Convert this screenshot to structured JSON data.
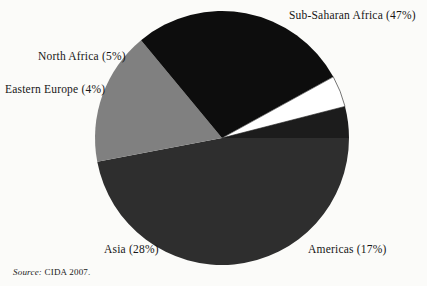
{
  "chart_data": {
    "type": "pie",
    "title": "",
    "subtitle": "",
    "xlabel": "",
    "ylabel": "",
    "legend_position": "none",
    "grid": false,
    "units": "percent",
    "total": 101,
    "categories": [
      "Sub-Saharan Africa",
      "Americas",
      "Asia",
      "Eastern Europe",
      "North Africa"
    ],
    "values": [
      47,
      17,
      28,
      4,
      5
    ],
    "labels": [
      "Sub-Saharan Africa (47%)",
      "Americas (17%)",
      "Asia (28%)",
      "Eastern Europe (4%)",
      "North Africa (5%)"
    ],
    "slices": [
      {
        "name": "Sub-Saharan Africa",
        "value": 47,
        "label": "Sub-Saharan Africa (47%)",
        "color": "#2e2e2e",
        "start_angle": 0,
        "end_angle": 169.2
      },
      {
        "name": "Americas",
        "value": 17,
        "label": "Americas (17%)",
        "color": "#808080",
        "start_angle": 169.2,
        "end_angle": 230.4
      },
      {
        "name": "Asia",
        "value": 28,
        "label": "Asia (28%)",
        "color": "#0d0d0d",
        "start_angle": 230.4,
        "end_angle": 331.2
      },
      {
        "name": "Eastern Europe",
        "value": 4,
        "label": "Eastern Europe (4%)",
        "color": "#ffffff",
        "start_angle": 331.2,
        "end_angle": 345.6
      },
      {
        "name": "North Africa",
        "value": 5,
        "label": "North Africa (5%)",
        "color": "#1c1c1c",
        "start_angle": 345.6,
        "end_angle": 360
      }
    ]
  },
  "labels": {
    "sub_saharan_africa": "Sub-Saharan Africa (47%)",
    "north_africa": "North Africa (5%)",
    "eastern_europe": "Eastern Europe (4%)",
    "asia": "Asia (28%)",
    "americas": "Americas (17%)"
  },
  "source": {
    "prefix": "Source:",
    "text": "CIDA 2007."
  },
  "colors": {
    "background": "#fbfbf9",
    "sub_saharan_africa": "#2e2e2e",
    "americas": "#808080",
    "asia": "#0d0d0d",
    "eastern_europe": "#ffffff",
    "north_africa": "#1c1c1c",
    "text": "#161616"
  }
}
